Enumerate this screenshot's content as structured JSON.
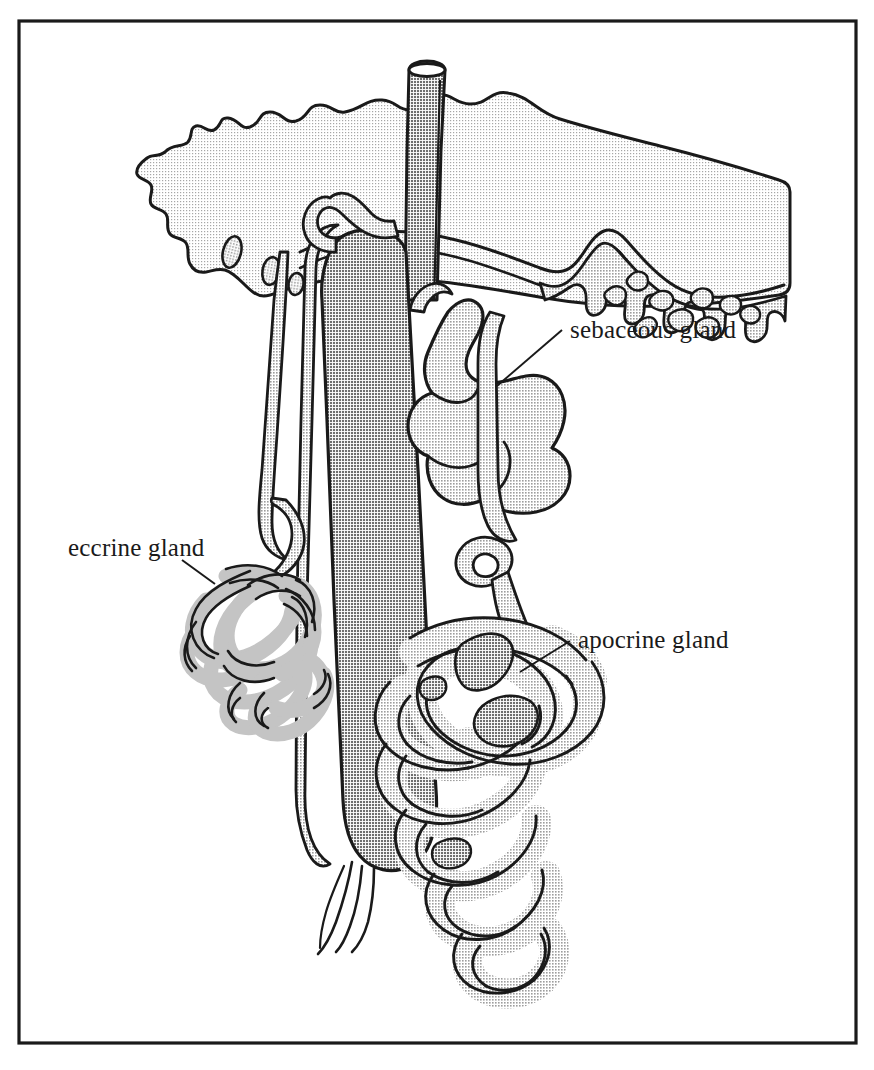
{
  "figure": {
    "border_color": "#1a1a1a",
    "background_color": "#ffffff"
  },
  "labels": [
    {
      "id": "sebaceous",
      "text": "sebaceous gland",
      "x": 570,
      "y": 338
    },
    {
      "id": "eccrine",
      "text": "eccrine gland",
      "x": 68,
      "y": 556
    },
    {
      "id": "apocrine",
      "text": "apocrine gland",
      "x": 578,
      "y": 648
    }
  ],
  "structures": {
    "epidermis_label": "epidermis",
    "dermis_label": "dermis",
    "hair_shaft_label": "hair shaft",
    "hair_follicle_label": "hair follicle",
    "hair_bulb_label": "hair bulb",
    "eccrine_duct_label": "eccrine duct",
    "apocrine_duct_label": "apocrine duct",
    "sebaceous_duct_label": "sebaceous duct"
  },
  "colors": {
    "outline": "#1a1a1a",
    "epidermis_fill": "#ececec",
    "dermis_papillae_fill": "#c9c9c9",
    "hair_shaft_fill": "#a3a3a3",
    "follicle_sheath_fill": "#cccccc",
    "sebaceous_fill": "#c6c6c6",
    "eccrine_fill": "#c4c4c4",
    "apocrine_fill": "#c9c9c9",
    "apocrine_shadow_fill": "#a8a8a8",
    "leader_line": "#1a1a1a"
  }
}
